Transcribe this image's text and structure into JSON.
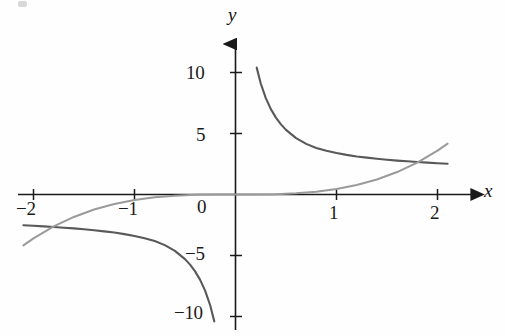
{
  "figure": {
    "background_color": "#fefefe",
    "axis_color": "#1a1a1a",
    "curve_colors": {
      "dark": "#595959",
      "light": "#9a9a9a"
    }
  },
  "axes": {
    "x_label": "x",
    "y_label": "y",
    "origin_label": "0",
    "x_ticks": [
      {
        "value": -2,
        "label": "−2"
      },
      {
        "value": -1,
        "label": "−1"
      },
      {
        "value": 1,
        "label": "1"
      },
      {
        "value": 2,
        "label": "2"
      }
    ],
    "y_ticks": [
      {
        "value": 10,
        "label": "10"
      },
      {
        "value": 5,
        "label": "5"
      },
      {
        "value": -5,
        "label": "−5"
      },
      {
        "value": -10,
        "label": "−10"
      }
    ]
  },
  "chart_data": {
    "type": "line",
    "title": "",
    "xlabel": "x",
    "ylabel": "y",
    "xlim": [
      -2.15,
      2.25
    ],
    "ylim": [
      -11.0,
      11.5
    ],
    "grid": false,
    "legend_position": "none",
    "series": [
      {
        "name": "dark-curve",
        "color": "#595959",
        "description": "hyperbola y = 2.2/x, drawn in branches on both sides of the y-axis",
        "linewidth": 2.1,
        "branches": [
          {
            "name": "positive-branch",
            "x": [
              0.21,
              0.25,
              0.3,
              0.35,
              0.4,
              0.45,
              0.5,
              0.6,
              0.7,
              0.8,
              0.9,
              1.0,
              1.1,
              1.2,
              1.3,
              1.4,
              1.5,
              1.6,
              1.7,
              1.8,
              1.9,
              2.0,
              2.1
            ],
            "y": [
              10.4,
              9.1,
              7.9,
              7.0,
              6.3,
              5.75,
              5.3,
              4.62,
              4.15,
              3.82,
              3.58,
              3.4,
              3.25,
              3.12,
              3.02,
              2.93,
              2.85,
              2.78,
              2.72,
              2.66,
              2.61,
              2.56,
              2.52
            ]
          },
          {
            "name": "negative-branch",
            "x": [
              -2.1,
              -2.0,
              -1.9,
              -1.8,
              -1.7,
              -1.6,
              -1.5,
              -1.4,
              -1.3,
              -1.2,
              -1.1,
              -1.0,
              -0.9,
              -0.8,
              -0.7,
              -0.6,
              -0.5,
              -0.45,
              -0.4,
              -0.35,
              -0.3,
              -0.25,
              -0.21
            ],
            "y": [
              -2.52,
              -2.56,
              -2.61,
              -2.66,
              -2.72,
              -2.78,
              -2.85,
              -2.93,
              -3.02,
              -3.12,
              -3.25,
              -3.4,
              -3.58,
              -3.82,
              -4.15,
              -4.62,
              -5.3,
              -5.75,
              -6.3,
              -7.0,
              -7.9,
              -9.1,
              -10.4
            ]
          }
        ]
      },
      {
        "name": "light-curve",
        "color": "#9a9a9a",
        "description": "odd increasing curve y = 0.45*x^3, passing through the origin",
        "linewidth": 2.0,
        "x": [
          -2.1,
          -2.0,
          -1.8,
          -1.6,
          -1.4,
          -1.2,
          -1.0,
          -0.8,
          -0.6,
          -0.4,
          -0.2,
          0.0,
          0.2,
          0.4,
          0.6,
          0.8,
          1.0,
          1.2,
          1.4,
          1.6,
          1.8,
          2.0,
          2.1
        ],
        "y": [
          -4.17,
          -3.6,
          -2.62,
          -1.84,
          -1.23,
          -0.78,
          -0.45,
          -0.23,
          -0.1,
          -0.03,
          -0.004,
          0.0,
          0.004,
          0.03,
          0.1,
          0.23,
          0.45,
          0.78,
          1.23,
          1.84,
          2.62,
          3.6,
          4.17
        ]
      }
    ],
    "intersections": [
      {
        "x": -1.55,
        "y": -1.68
      },
      {
        "x": 1.55,
        "y": 1.68
      }
    ]
  }
}
